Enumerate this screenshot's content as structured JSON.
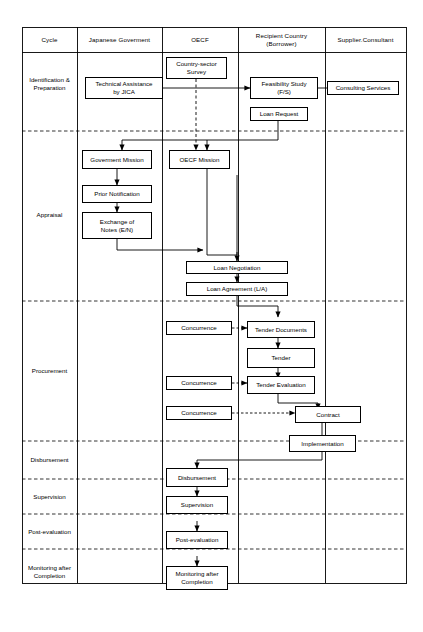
{
  "diagram": {
    "type": "swimlane-flowchart",
    "columns": [
      {
        "id": "cycle",
        "label": "Cycle"
      },
      {
        "id": "jp_gov",
        "label": "Japanese Goverment"
      },
      {
        "id": "oecf",
        "label": "OECF"
      },
      {
        "id": "recipient",
        "label": "Recipient Country\n(Borrower)",
        "line1": "Recipient Country",
        "line2": "(Borrower)"
      },
      {
        "id": "supplier",
        "label": "Supplier.Consultant"
      }
    ],
    "phases": [
      {
        "id": "identification",
        "label": "Identification &\nPreparation",
        "line1": "Identification &",
        "line2": "Preparation"
      },
      {
        "id": "appraisal",
        "label": "Appraisal"
      },
      {
        "id": "procurement",
        "label": "Procurement"
      },
      {
        "id": "disbursement",
        "label": "Disbursement"
      },
      {
        "id": "supervision",
        "label": "Supervision"
      },
      {
        "id": "post_evaluation",
        "label": "Post-evaluation"
      },
      {
        "id": "monitoring",
        "label": "Monitoring after\nCompletion",
        "line1": "Monitoring after",
        "line2": "Completion"
      }
    ],
    "nodes": [
      {
        "id": "country_sector_survey",
        "label": "Country-sector\nSurvey",
        "line1": "Country-sector",
        "line2": "Survey",
        "column": "oecf",
        "phase": "identification"
      },
      {
        "id": "technical_assistance",
        "label": "Technical Assistance\nby JICA",
        "line1": "Technical Assistance",
        "line2": "by JICA",
        "column": "jp_gov",
        "phase": "identification"
      },
      {
        "id": "feasibility_study",
        "label": "Feasibility Study\n(F/S)",
        "line1": "Feasibility Study",
        "line2": "(F/S)",
        "column": "recipient",
        "phase": "identification"
      },
      {
        "id": "consulting_services",
        "label": "Consulting Services",
        "column": "supplier",
        "phase": "identification"
      },
      {
        "id": "loan_request",
        "label": "Loan Request",
        "column": "recipient",
        "phase": "identification"
      },
      {
        "id": "government_mission",
        "label": "Goverment Mission",
        "column": "jp_gov",
        "phase": "appraisal"
      },
      {
        "id": "oecf_mission",
        "label": "OECF Mission",
        "column": "oecf",
        "phase": "appraisal"
      },
      {
        "id": "prior_notification",
        "label": "Prior Notification",
        "column": "jp_gov",
        "phase": "appraisal"
      },
      {
        "id": "exchange_of_notes",
        "label": "Exchange of\nNotes (E/N)",
        "line1": "Exchange of",
        "line2": "Notes (E/N)",
        "column": "jp_gov",
        "phase": "appraisal"
      },
      {
        "id": "loan_negotiation",
        "label": "Loan Negotiation",
        "column": "recipient",
        "phase": "appraisal"
      },
      {
        "id": "loan_agreement",
        "label": "Loan Agreement (L/A)",
        "column": "recipient",
        "phase": "appraisal"
      },
      {
        "id": "concurrence_1",
        "label": "Concurrence",
        "column": "oecf",
        "phase": "procurement"
      },
      {
        "id": "tender_documents",
        "label": "Tender Documents",
        "column": "recipient",
        "phase": "procurement"
      },
      {
        "id": "tender",
        "label": "Tender",
        "column": "recipient",
        "phase": "procurement"
      },
      {
        "id": "concurrence_2",
        "label": "Concurrence",
        "column": "oecf",
        "phase": "procurement"
      },
      {
        "id": "tender_evaluation",
        "label": "Tender Evaluation",
        "column": "recipient",
        "phase": "procurement"
      },
      {
        "id": "concurrence_3",
        "label": "Concurrence",
        "column": "oecf",
        "phase": "procurement"
      },
      {
        "id": "contract",
        "label": "Contract",
        "column": "recipient",
        "phase": "procurement"
      },
      {
        "id": "implementation",
        "label": "Implementation",
        "column": "supplier",
        "phase": "disbursement"
      },
      {
        "id": "disbursement_box",
        "label": "Disbursement",
        "column": "oecf",
        "phase": "disbursement"
      },
      {
        "id": "supervision_box",
        "label": "Supervision",
        "column": "oecf",
        "phase": "supervision"
      },
      {
        "id": "post_evaluation_box",
        "label": "Post-evaluation",
        "column": "oecf",
        "phase": "post_evaluation"
      },
      {
        "id": "monitoring_box",
        "label": "Monitoring after\nCompletion",
        "line1": "Monitoring after",
        "line2": "Completion",
        "column": "oecf",
        "phase": "monitoring"
      }
    ],
    "edges": [
      {
        "from": "country_sector_survey",
        "to": "oecf_mission",
        "style": "dashed"
      },
      {
        "from": "technical_assistance",
        "to": "feasibility_study",
        "style": "solid"
      },
      {
        "from": "consulting_services",
        "to": "feasibility_study",
        "style": "solid"
      },
      {
        "from": "loan_request",
        "to": "government_mission",
        "style": "solid"
      },
      {
        "from": "loan_request",
        "to": "oecf_mission",
        "style": "solid"
      },
      {
        "from": "government_mission",
        "to": "prior_notification",
        "style": "solid"
      },
      {
        "from": "prior_notification",
        "to": "exchange_of_notes",
        "style": "solid"
      },
      {
        "from": "exchange_of_notes",
        "to": "loan_negotiation",
        "style": "solid"
      },
      {
        "from": "oecf_mission",
        "to": "loan_negotiation",
        "style": "solid"
      },
      {
        "from": "loan_negotiation",
        "to": "loan_agreement",
        "style": "solid"
      },
      {
        "from": "loan_agreement",
        "to": "tender_documents",
        "style": "solid"
      },
      {
        "from": "concurrence_1",
        "to": "tender_documents",
        "style": "dashed"
      },
      {
        "from": "tender_documents",
        "to": "tender",
        "style": "solid"
      },
      {
        "from": "tender",
        "to": "tender_evaluation",
        "style": "solid"
      },
      {
        "from": "concurrence_2",
        "to": "tender_evaluation",
        "style": "dashed"
      },
      {
        "from": "tender_evaluation",
        "to": "contract",
        "style": "solid"
      },
      {
        "from": "concurrence_3",
        "to": "contract",
        "style": "dashed"
      },
      {
        "from": "contract",
        "to": "implementation",
        "style": "solid"
      },
      {
        "from": "implementation",
        "to": "disbursement_box",
        "style": "solid"
      },
      {
        "from": "disbursement_box",
        "to": "supervision_box",
        "style": "solid"
      },
      {
        "from": "supervision_box",
        "to": "post_evaluation_box",
        "style": "solid"
      },
      {
        "from": "post_evaluation_box",
        "to": "monitoring_box",
        "style": "solid"
      }
    ],
    "colors": {
      "line": "#000000",
      "background": "#ffffff",
      "box_fill": "#ffffff"
    }
  }
}
